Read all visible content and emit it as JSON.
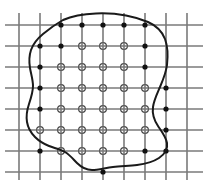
{
  "figure": {
    "width": 210,
    "height": 186,
    "background_color": "#ffffff"
  },
  "grid": {
    "name": "uniform-rectangular-grid",
    "line_color": "#7a7a7a",
    "line_width": 1.6,
    "spacing_x": 21,
    "spacing_y": 21,
    "vertical_line_count": 9,
    "horizontal_line_count": 8,
    "vertical_line_x": [
      19,
      40,
      61,
      82,
      103,
      124,
      145,
      166,
      187
    ],
    "horizontal_line_y": [
      25,
      46,
      67,
      88,
      109,
      130,
      151,
      172
    ],
    "vertical_line_top": 13,
    "vertical_line_bottom": 180,
    "horizontal_line_left": 5,
    "horizontal_line_right": 203
  },
  "curve": {
    "name": "region-boundary-curve",
    "stroke_color": "#1a1a1a",
    "stroke_width": 2.0,
    "closed": true,
    "path": "M 63 20 C 72 16 84 14 96 13.5 C 108 13 118 14 126 15.5 C 134 17 141 19 148 22 C 156 25.5 162 31 165 39 C 168 47 168 56 167 65 C 166 73 163 80 160 87 C 157 94 154 100 153 107 C 152 114 154 120 158 126 C 162 132 166 137 167 143 C 168 149 165 154 159 158 C 153 162 145 164 137 165 C 129 166 121 166 113 167 C 105 168 98 170 92 170 C 86 170 81 167 77 163 C 73 159 70 155 65 152 C 60 149 54 148 49 146 C 44 144 39 141 35 137 C 31 133 28 128 27 122 C 26 116 27 110 29 104 C 31 98 33 92 33 86 C 33 80 31 74 30 68 C 29 62 29 56 31 50 C 33 44 37 39 43 34 C 49 29 56 24 63 20 Z"
  },
  "markers": {
    "boundary_node": {
      "name": "boundary-node-marker",
      "style": "filled-dot",
      "color": "#111111",
      "radius": 2.6,
      "count": 30,
      "points": [
        [
          61,
          25
        ],
        [
          82,
          25
        ],
        [
          103,
          25
        ],
        [
          124,
          25
        ],
        [
          145,
          25
        ],
        [
          40,
          46
        ],
        [
          145,
          46
        ],
        [
          40,
          67
        ],
        [
          145,
          67
        ],
        [
          40,
          88
        ],
        [
          166,
          88
        ],
        [
          40,
          109
        ],
        [
          166,
          109
        ],
        [
          40,
          130
        ],
        [
          166,
          130
        ],
        [
          40,
          151
        ],
        [
          61,
          151
        ],
        [
          82,
          151
        ],
        [
          103,
          151
        ],
        [
          145,
          151
        ],
        [
          166,
          151
        ],
        [
          103,
          172
        ],
        [
          61,
          46
        ],
        [
          61,
          67
        ],
        [
          61,
          88
        ],
        [
          145,
          88
        ],
        [
          145,
          109
        ],
        [
          145,
          130
        ],
        [
          124,
          46
        ],
        [
          124,
          67
        ]
      ]
    },
    "interior_node": {
      "name": "interior-node-marker",
      "style": "open-circle-on-grid-crossing",
      "stroke_color": "#444444",
      "fill_color": "#ffffff",
      "radius": 3.4,
      "stroke_width": 1.2,
      "count": 31,
      "points": [
        [
          82,
          46
        ],
        [
          103,
          46
        ],
        [
          82,
          67
        ],
        [
          103,
          67
        ],
        [
          61,
          88
        ],
        [
          82,
          88
        ],
        [
          103,
          88
        ],
        [
          124,
          88
        ],
        [
          61,
          109
        ],
        [
          82,
          109
        ],
        [
          103,
          109
        ],
        [
          124,
          109
        ],
        [
          145,
          109
        ],
        [
          61,
          130
        ],
        [
          82,
          130
        ],
        [
          103,
          130
        ],
        [
          124,
          130
        ],
        [
          145,
          130
        ],
        [
          103,
          151
        ],
        [
          124,
          151
        ],
        [
          61,
          67
        ],
        [
          124,
          67
        ],
        [
          40,
          109
        ],
        [
          40,
          130
        ],
        [
          82,
          151
        ],
        [
          61,
          151
        ],
        [
          145,
          88
        ],
        [
          124,
          46
        ],
        [
          61,
          46
        ],
        [
          145,
          67
        ],
        [
          40,
          88
        ]
      ]
    }
  },
  "rendered_nodes": {
    "interior": [
      [
        82,
        46
      ],
      [
        103,
        46
      ],
      [
        124,
        46
      ],
      [
        61,
        67
      ],
      [
        82,
        67
      ],
      [
        103,
        67
      ],
      [
        124,
        67
      ],
      [
        61,
        88
      ],
      [
        82,
        88
      ],
      [
        103,
        88
      ],
      [
        124,
        88
      ],
      [
        145,
        88
      ],
      [
        61,
        109
      ],
      [
        82,
        109
      ],
      [
        103,
        109
      ],
      [
        124,
        109
      ],
      [
        145,
        109
      ],
      [
        40,
        130
      ],
      [
        61,
        130
      ],
      [
        82,
        130
      ],
      [
        103,
        130
      ],
      [
        124,
        130
      ],
      [
        145,
        130
      ],
      [
        103,
        151
      ],
      [
        124,
        151
      ],
      [
        61,
        151
      ],
      [
        82,
        151
      ]
    ],
    "boundary": [
      [
        61,
        25
      ],
      [
        82,
        25
      ],
      [
        103,
        25
      ],
      [
        124,
        25
      ],
      [
        145,
        25
      ],
      [
        40,
        46
      ],
      [
        61,
        46
      ],
      [
        145,
        46
      ],
      [
        40,
        67
      ],
      [
        145,
        67
      ],
      [
        40,
        88
      ],
      [
        166,
        88
      ],
      [
        40,
        109
      ],
      [
        166,
        109
      ],
      [
        166,
        130
      ],
      [
        40,
        151
      ],
      [
        145,
        151
      ],
      [
        166,
        151
      ],
      [
        103,
        172
      ]
    ]
  }
}
